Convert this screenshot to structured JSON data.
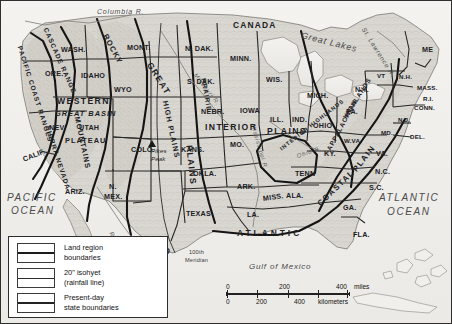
{
  "map": {
    "title": "United States land regions map",
    "countries": [
      {
        "name": "CANADA",
        "x": 232,
        "y": 24
      },
      {
        "name": "MEXICO",
        "x": 130,
        "y": 248
      }
    ],
    "oceans": [
      {
        "name": "PACIFIC",
        "x": 8,
        "y": 196
      },
      {
        "name": "OCEAN",
        "x": 10,
        "y": 208
      },
      {
        "name": "ATLANTIC",
        "x": 382,
        "y": 196
      },
      {
        "name": "OCEAN",
        "x": 388,
        "y": 209
      },
      {
        "name": "Gulf of Mexico",
        "x": 262,
        "y": 265
      }
    ],
    "water_features": [
      {
        "name": "Columbia R.",
        "x": 98,
        "y": 10
      },
      {
        "name": "Great Lakes",
        "x": 306,
        "y": 34
      },
      {
        "name": "St. Lawrence R.",
        "x": 366,
        "y": 28
      },
      {
        "name": "Rio Grande",
        "x": 112,
        "y": 232
      },
      {
        "name": "Mississippi R.",
        "x": 258,
        "y": 128
      },
      {
        "name": "Missouri R.",
        "x": 196,
        "y": 74
      },
      {
        "name": "Ohio R.",
        "x": 300,
        "y": 156
      }
    ],
    "regions": [
      {
        "name": "PACIFIC COAST RANGES",
        "x": 20,
        "y": 46
      },
      {
        "name": "CASCADE RANGE",
        "x": 46,
        "y": 28
      },
      {
        "name": "SIERRA NEVADA",
        "x": 48,
        "y": 128
      },
      {
        "name": "ROCKY",
        "x": 108,
        "y": 36
      },
      {
        "name": "MOUNTAINS",
        "x": 78,
        "y": 118
      },
      {
        "name": "WESTERN",
        "x": 60,
        "y": 100
      },
      {
        "name": "GREAT BASIN",
        "x": 58,
        "y": 113
      },
      {
        "name": "PLATEAU",
        "x": 68,
        "y": 140
      },
      {
        "name": "GREAT",
        "x": 152,
        "y": 62
      },
      {
        "name": "HIGH PLAINS",
        "x": 166,
        "y": 100
      },
      {
        "name": "PLAINS",
        "x": 190,
        "y": 170
      },
      {
        "name": "PRAIRIE",
        "x": 204,
        "y": 80
      },
      {
        "name": "INTERIOR",
        "x": 206,
        "y": 126
      },
      {
        "name": "PLAINS",
        "x": 270,
        "y": 130
      },
      {
        "name": "INTERIOR HIGHLANDS",
        "x": 286,
        "y": 150
      },
      {
        "name": "APPALACHIAN",
        "x": 330,
        "y": 150
      },
      {
        "name": "HIGHLANDS",
        "x": 346,
        "y": 118
      },
      {
        "name": "COASTAL",
        "x": 322,
        "y": 205
      },
      {
        "name": "PLAIN",
        "x": 358,
        "y": 170
      },
      {
        "name": "ATLANTIC",
        "x": 240,
        "y": 232
      }
    ],
    "states": [
      {
        "name": "WASH.",
        "x": 62,
        "y": 48
      },
      {
        "name": "ORE.",
        "x": 46,
        "y": 72
      },
      {
        "name": "IDAHO",
        "x": 84,
        "y": 74
      },
      {
        "name": "MONT.",
        "x": 130,
        "y": 46
      },
      {
        "name": "N. DAK.",
        "x": 188,
        "y": 47
      },
      {
        "name": "MINN.",
        "x": 233,
        "y": 57
      },
      {
        "name": "WIS.",
        "x": 268,
        "y": 78
      },
      {
        "name": "MICH.",
        "x": 310,
        "y": 94
      },
      {
        "name": "WYO",
        "x": 117,
        "y": 88
      },
      {
        "name": "S. DAK.",
        "x": 190,
        "y": 80
      },
      {
        "name": "NEBR.",
        "x": 204,
        "y": 110
      },
      {
        "name": "IOWA",
        "x": 243,
        "y": 109
      },
      {
        "name": "ILL.",
        "x": 272,
        "y": 118
      },
      {
        "name": "IND.",
        "x": 295,
        "y": 118
      },
      {
        "name": "OHIO",
        "x": 316,
        "y": 124
      },
      {
        "name": "PA.",
        "x": 348,
        "y": 110
      },
      {
        "name": "N.Y.",
        "x": 358,
        "y": 88
      },
      {
        "name": "VT",
        "x": 378,
        "y": 75
      },
      {
        "name": "N.H.",
        "x": 400,
        "y": 76
      },
      {
        "name": "ME",
        "x": 424,
        "y": 48
      },
      {
        "name": "MASS.",
        "x": 420,
        "y": 87
      },
      {
        "name": "R.I.",
        "x": 425,
        "y": 98
      },
      {
        "name": "CONN.",
        "x": 417,
        "y": 107
      },
      {
        "name": "N.J.",
        "x": 400,
        "y": 119
      },
      {
        "name": "DEL.",
        "x": 412,
        "y": 136
      },
      {
        "name": "MD.",
        "x": 383,
        "y": 132
      },
      {
        "name": "W.VA.",
        "x": 347,
        "y": 140
      },
      {
        "name": "VA.",
        "x": 378,
        "y": 152
      },
      {
        "name": "NEV.",
        "x": 50,
        "y": 126
      },
      {
        "name": "UTAH",
        "x": 82,
        "y": 126
      },
      {
        "name": "COLO.",
        "x": 136,
        "y": 148
      },
      {
        "name": "CALIF.",
        "x": 26,
        "y": 158
      },
      {
        "name": "ARIZ.",
        "x": 68,
        "y": 190
      },
      {
        "name": "N.",
        "x": 110,
        "y": 185
      },
      {
        "name": "MEX.",
        "x": 107,
        "y": 195
      },
      {
        "name": "KANS.",
        "x": 184,
        "y": 148
      },
      {
        "name": "MO.",
        "x": 232,
        "y": 143
      },
      {
        "name": "KY.",
        "x": 326,
        "y": 152
      },
      {
        "name": "OKLA.",
        "x": 196,
        "y": 172
      },
      {
        "name": "ARK.",
        "x": 240,
        "y": 185
      },
      {
        "name": "TENN",
        "x": 298,
        "y": 172
      },
      {
        "name": "N.C.",
        "x": 378,
        "y": 170
      },
      {
        "name": "S.C.",
        "x": 372,
        "y": 186
      },
      {
        "name": "TEXAS",
        "x": 190,
        "y": 212
      },
      {
        "name": "LA.",
        "x": 248,
        "y": 213
      },
      {
        "name": "MISS.",
        "x": 266,
        "y": 197
      },
      {
        "name": "ALA.",
        "x": 289,
        "y": 194
      },
      {
        "name": "GA.",
        "x": 345,
        "y": 206
      },
      {
        "name": "FLA.",
        "x": 355,
        "y": 233
      }
    ],
    "annotations": [
      {
        "name": "Pikes",
        "x": 152,
        "y": 150
      },
      {
        "name": "Peak",
        "x": 152,
        "y": 158
      },
      {
        "name": "100th",
        "x": 190,
        "y": 252
      },
      {
        "name": "Meridian",
        "x": 186,
        "y": 260
      }
    ]
  },
  "legend": {
    "items": [
      {
        "id": "land-region-boundaries",
        "line1": "Land region",
        "line2": "boundaries"
      },
      {
        "id": "isohyet",
        "line1": "20\" isohyet",
        "line2": "(rainfall line)"
      },
      {
        "id": "state-boundaries",
        "line1": "Present-day",
        "line2": "state boundaries"
      }
    ]
  },
  "scale": {
    "miles": {
      "ticks": [
        "0",
        "200",
        "400"
      ],
      "unit": "miles"
    },
    "kilometers": {
      "ticks": [
        "0",
        "200",
        "400"
      ],
      "unit": "kilometers"
    }
  },
  "colors": {
    "frame": "#2e2e2e",
    "land": "#d8d6d0",
    "ocean": "#f1f0ed",
    "boundary": "#1b1b1b"
  }
}
